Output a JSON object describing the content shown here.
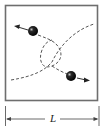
{
  "diagram": {
    "title": "",
    "box": {
      "description": "square container",
      "stroke": "#6e6e6e",
      "fill": "#ffffff"
    },
    "particles": [
      {
        "id": "particle-1",
        "position": "upper-left",
        "direction": "left",
        "color": "#111111"
      },
      {
        "id": "particle-2",
        "position": "lower-right",
        "direction": "right",
        "color": "#111111"
      }
    ],
    "trajectories": {
      "style": "dashed",
      "color": "#555555"
    },
    "dimension": {
      "label": "L",
      "description": "side length of box"
    }
  }
}
